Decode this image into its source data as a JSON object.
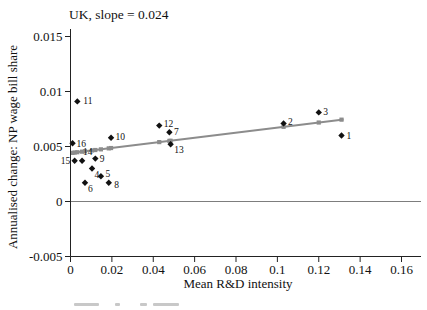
{
  "page": {
    "background": "#ffffff"
  },
  "chart_data": {
    "type": "scatter",
    "title": "UK, slope = 0.024",
    "xlabel": "Mean R&D intensity",
    "ylabel": "Annualised change: NP wage bill share",
    "xlim": [
      0,
      0.17
    ],
    "ylim": [
      -0.005,
      0.015
    ],
    "x_tick_labels": [
      "0",
      "0.02",
      "0.04",
      "0.06",
      "0.08",
      "0.1",
      "0.12",
      "0.14",
      "0.16"
    ],
    "y_tick_labels": [
      "-0.005",
      "0",
      "0.005",
      "0.01",
      "0.015"
    ],
    "grid": "off",
    "zero_line": true,
    "legend": "none",
    "slope_shown_in_title": 0.024,
    "colors": {
      "observation_marker": "#111111",
      "fitted_marker": "#8c8c8c",
      "fit_line": "#8c8c8c",
      "axis": "#222222",
      "zero_line": "#6e6e6e",
      "text": "#111111"
    },
    "series": [
      {
        "name": "industry-observations",
        "marker": "diamond",
        "color": "#111111",
        "points": [
          {
            "label": "1",
            "x": 0.131,
            "y": 0.006
          },
          {
            "label": "2",
            "x": 0.103,
            "y": 0.0071
          },
          {
            "label": "3",
            "x": 0.12,
            "y": 0.0081
          },
          {
            "label": "4",
            "x": 0.0104,
            "y": 0.003
          },
          {
            "label": "5",
            "x": 0.0147,
            "y": 0.0023
          },
          {
            "label": "6",
            "x": 0.007,
            "y": 0.0017
          },
          {
            "label": "7",
            "x": 0.0478,
            "y": 0.0063
          },
          {
            "label": "8",
            "x": 0.0185,
            "y": 0.0017
          },
          {
            "label": "9",
            "x": 0.012,
            "y": 0.0039
          },
          {
            "label": "10",
            "x": 0.0196,
            "y": 0.0058
          },
          {
            "label": "11",
            "x": 0.0033,
            "y": 0.0091
          },
          {
            "label": "12",
            "x": 0.0429,
            "y": 0.0069
          },
          {
            "label": "13",
            "x": 0.0484,
            "y": 0.0052
          },
          {
            "label": "14",
            "x": 0.0056,
            "y": 0.0037
          },
          {
            "label": "15",
            "x": 0.002,
            "y": 0.0037
          },
          {
            "label": "16",
            "x": 0.001,
            "y": 0.0053
          }
        ]
      },
      {
        "name": "fitted-values",
        "marker": "square",
        "color": "#8c8c8c",
        "points": [
          {
            "x": 0.001,
            "y": 0.00442
          },
          {
            "x": 0.002,
            "y": 0.00445
          },
          {
            "x": 0.0033,
            "y": 0.00448
          },
          {
            "x": 0.0056,
            "y": 0.00453
          },
          {
            "x": 0.007,
            "y": 0.00456
          },
          {
            "x": 0.0104,
            "y": 0.00464
          },
          {
            "x": 0.012,
            "y": 0.00468
          },
          {
            "x": 0.0147,
            "y": 0.00474
          },
          {
            "x": 0.0185,
            "y": 0.00483
          },
          {
            "x": 0.0196,
            "y": 0.00486
          },
          {
            "x": 0.0429,
            "y": 0.0054
          },
          {
            "x": 0.0478,
            "y": 0.00551
          },
          {
            "x": 0.0484,
            "y": 0.00552
          },
          {
            "x": 0.103,
            "y": 0.00679
          },
          {
            "x": 0.12,
            "y": 0.00718
          },
          {
            "x": 0.131,
            "y": 0.00744
          }
        ]
      }
    ],
    "fit_line": {
      "x1": 0.0,
      "y1": 0.0044,
      "x2": 0.132,
      "y2": 0.00746
    }
  }
}
